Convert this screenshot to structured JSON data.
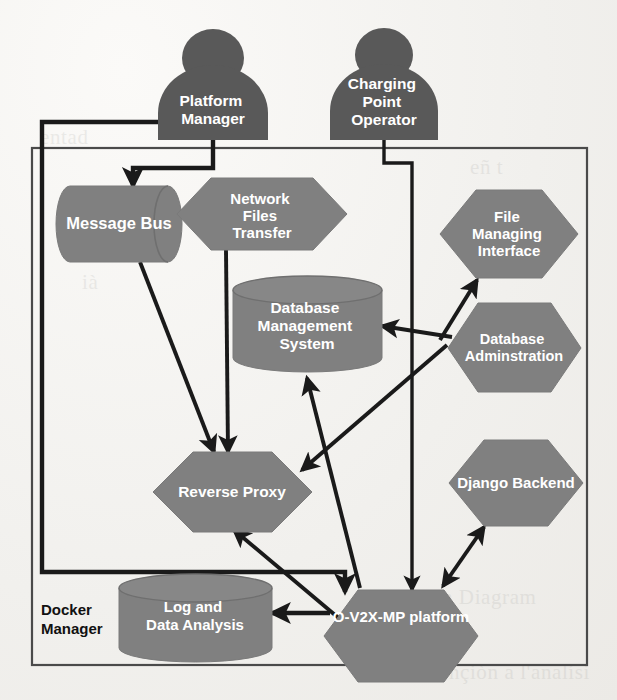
{
  "diagram": {
    "container": {
      "label": "Docker Manager"
    },
    "colors": {
      "actor_fill": "#595959",
      "node_fill": "#808080",
      "node_edge": "#6e6e6e",
      "line": "#1a1a1a",
      "box_edge": "#3a3a3a",
      "label_text": "#ffffff",
      "page_bg": "#f2f1ee"
    },
    "actors": [
      {
        "id": "platform-manager",
        "label": "Platform Manager",
        "lines": [
          "Platform",
          "Manager"
        ]
      },
      {
        "id": "charging-point-operator",
        "label": "Charging Point Operator",
        "lines": [
          "Charging",
          "Point",
          "Operator"
        ]
      }
    ],
    "nodes": [
      {
        "id": "message-bus",
        "label": "Message Bus",
        "lines": [
          "Message Bus"
        ],
        "shape": "cylinder-h"
      },
      {
        "id": "network-files-transfer",
        "label": "Network Files Transfer",
        "lines": [
          "Network",
          "Files",
          "Transfer"
        ],
        "shape": "hexagon"
      },
      {
        "id": "file-managing-interface",
        "label": "File Managing Interface",
        "lines": [
          "File",
          "Managing",
          "Interface"
        ],
        "shape": "hexagon"
      },
      {
        "id": "database-management-system",
        "label": "Database Management System",
        "lines": [
          "Database",
          "Management",
          "System"
        ],
        "shape": "cylinder-v"
      },
      {
        "id": "database-administration",
        "label": "Database Adminstration",
        "lines": [
          "Database",
          "Adminstration"
        ],
        "shape": "hexagon"
      },
      {
        "id": "reverse-proxy",
        "label": "Reverse Proxy",
        "lines": [
          "Reverse Proxy"
        ],
        "shape": "hexagon"
      },
      {
        "id": "django-backend",
        "label": "Django Backend",
        "lines": [
          "Django Backend"
        ],
        "shape": "hexagon"
      },
      {
        "id": "log-and-data-analysis",
        "label": "Log and Data Analysis",
        "lines": [
          "Log and",
          "Data Analysis"
        ],
        "shape": "cylinder-v"
      },
      {
        "id": "o-v2x-mp-platform",
        "label": "O-V2X-MP platform",
        "lines": [
          "O-V2X-MP platform"
        ],
        "shape": "hexagon"
      }
    ],
    "connections": [
      {
        "from": "platform-manager",
        "to": "message-bus",
        "style": "orthogonal",
        "arrow": "single"
      },
      {
        "from": "platform-manager",
        "to": "o-v2x-mp-platform",
        "style": "orthogonal",
        "arrow": "single"
      },
      {
        "from": "charging-point-operator",
        "to": "o-v2x-mp-platform",
        "style": "orthogonal",
        "arrow": "single"
      },
      {
        "from": "message-bus",
        "to": "reverse-proxy",
        "style": "straight",
        "arrow": "single"
      },
      {
        "from": "network-files-transfer",
        "to": "reverse-proxy",
        "style": "straight",
        "arrow": "single"
      },
      {
        "from": "o-v2x-mp-platform",
        "to": "database-management-system",
        "style": "straight",
        "arrow": "single"
      },
      {
        "from": "o-v2x-mp-platform",
        "to": "reverse-proxy",
        "style": "straight",
        "arrow": "single"
      },
      {
        "from": "o-v2x-mp-platform",
        "to": "log-and-data-analysis",
        "style": "straight",
        "arrow": "single"
      },
      {
        "from": "o-v2x-mp-platform",
        "to": "django-backend",
        "style": "straight",
        "arrow": "double"
      },
      {
        "from": "database-administration",
        "to": "file-managing-interface",
        "style": "straight",
        "arrow": "single"
      },
      {
        "from": "database-administration",
        "to": "database-management-system",
        "style": "straight",
        "arrow": "single"
      },
      {
        "from": "database-administration",
        "to": "reverse-proxy",
        "style": "straight",
        "arrow": "single"
      }
    ],
    "bleed_text": [
      {
        "text": "eñ t",
        "x": 470,
        "y": 155
      },
      {
        "text": "en Diagram",
        "x": 432,
        "y": 585
      },
      {
        "text": "l lìl",
        "x": 430,
        "y": 625
      },
      {
        "text": "intençiòn a l'analísi",
        "x": 415,
        "y": 660
      },
      {
        "text": "ià",
        "x": 82,
        "y": 270
      },
      {
        "text": "entad",
        "x": 40,
        "y": 125
      }
    ]
  }
}
